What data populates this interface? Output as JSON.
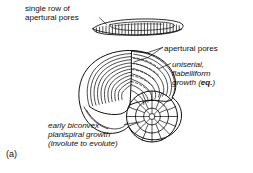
{
  "figure": {
    "label": "(a)",
    "background_color": "#ffffff",
    "ink_color": "#111111",
    "labels": {
      "single_row_of_apertural_pores": "single row of\napertural pores",
      "apertural_pores": "apertural pores",
      "uniserial_flabelliform_growth": "uniserial,\nflabelliform\ngrowth (",
      "uniserial_growth_emphasis": "eq.",
      "uniserial_growth_close": ")",
      "early_biconvex_planispiral": "early biconvex\nplanispiral growth\n(involute to evolute)"
    },
    "icons": {
      "edge_view": "foraminifera-edge-view-icon",
      "oblique_view": "foraminifera-oblique-view-icon",
      "leader_single_row": "leader-line-icon",
      "leader_apertural": "leader-line-forked-icon",
      "leader_uniserial": "leader-line-icon",
      "leader_early": "leader-line-icon"
    }
  }
}
